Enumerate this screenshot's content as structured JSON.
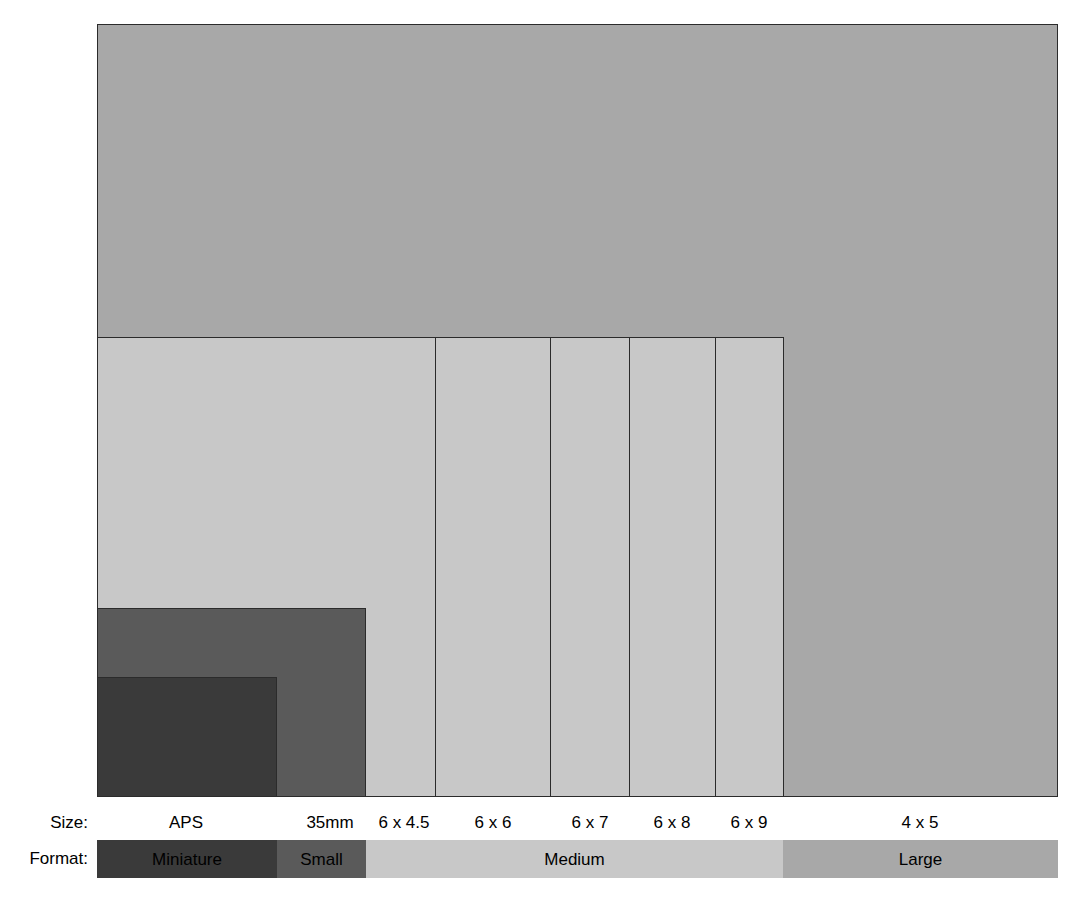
{
  "figure": {
    "kind": "film-format-size-comparison-diagram",
    "background_color": "#ffffff",
    "outline_color": "#2b2b2b"
  },
  "axis_labels": {
    "size_row": "Size:",
    "format_row": "Format:"
  },
  "chart_data": {
    "type": "bar",
    "title": "",
    "xlabel": "",
    "ylabel": "",
    "categories": [
      "APS",
      "35mm",
      "6 x 4.5",
      "6 x 6",
      "6 x 7",
      "6 x 8",
      "6 x 9",
      "4 x 5"
    ],
    "series": [
      {
        "name": "Frame width (px in figure)",
        "values": [
          180,
          88,
          68,
          115,
          79,
          86,
          68,
          274
        ]
      },
      {
        "name": "Frame height (px in figure)",
        "values": [
          119,
          189,
          460,
          460,
          460,
          460,
          460,
          773
        ]
      }
    ],
    "legend_position": "none",
    "grid": false
  },
  "frames": [
    {
      "id": "large-4x5",
      "size_label": "4 x 5",
      "format_group": "Large",
      "fill": "#a8a8a8",
      "x": 97,
      "y": 24,
      "w": 961,
      "h": 773,
      "label_center_x": 920
    },
    {
      "id": "medium-6x9",
      "size_label": "6 x 9",
      "format_group": "Medium",
      "fill": "#c8c8c8",
      "x": 97,
      "y": 337,
      "w": 687,
      "h": 460,
      "label_center_x": 749
    },
    {
      "id": "medium-6x8",
      "size_label": "6 x 8",
      "format_group": "Medium",
      "fill": "#c8c8c8",
      "x": 97,
      "y": 337,
      "w": 619,
      "h": 460,
      "label_center_x": 672
    },
    {
      "id": "medium-6x7",
      "size_label": "6 x 7",
      "format_group": "Medium",
      "fill": "#c8c8c8",
      "x": 97,
      "y": 337,
      "w": 533,
      "h": 460,
      "label_center_x": 590
    },
    {
      "id": "medium-6x6",
      "size_label": "6 x 6",
      "format_group": "Medium",
      "fill": "#c8c8c8",
      "x": 97,
      "y": 337,
      "w": 454,
      "h": 460,
      "label_center_x": 493
    },
    {
      "id": "medium-6x4-5",
      "size_label": "6 x 4.5",
      "format_group": "Medium",
      "fill": "#c8c8c8",
      "x": 97,
      "y": 337,
      "w": 339,
      "h": 460,
      "label_center_x": 404
    },
    {
      "id": "small-35mm",
      "size_label": "35mm",
      "format_group": "Small",
      "fill": "#5a5a5a",
      "x": 97,
      "y": 608,
      "w": 269,
      "h": 189,
      "label_center_x": 330
    },
    {
      "id": "miniature-aps",
      "size_label": "APS",
      "format_group": "Miniature",
      "fill": "#3a3a3a",
      "x": 97,
      "y": 677,
      "w": 180,
      "h": 120,
      "label_center_x": 186
    }
  ],
  "format_band": {
    "x": 97,
    "y": 840,
    "width": 961,
    "height": 38,
    "segments": [
      {
        "label": "Miniature",
        "fill": "#3a3a3a",
        "text_color": "#000000",
        "x": 97,
        "w": 180
      },
      {
        "label": "Small",
        "fill": "#5a5a5a",
        "text_color": "#000000",
        "x": 277,
        "w": 89
      },
      {
        "label": "Medium",
        "fill": "#c8c8c8",
        "text_color": "#000000",
        "x": 366,
        "w": 417
      },
      {
        "label": "Large",
        "fill": "#a8a8a8",
        "text_color": "#000000",
        "x": 783,
        "w": 275
      }
    ]
  }
}
